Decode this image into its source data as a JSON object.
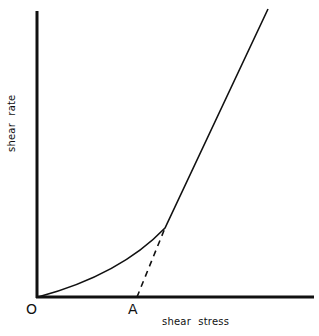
{
  "diagram": {
    "type": "line",
    "title": "",
    "xlabel": "shear stress",
    "ylabel": "shear rate",
    "points": {
      "origin": "O",
      "intercept": "A"
    },
    "curves": [
      {
        "name": "flow curve",
        "style": "solid",
        "description": "starts at origin, curves upward, becomes linear at high stress"
      },
      {
        "name": "extrapolated linear portion",
        "style": "dashed",
        "description": "extends linear region to intercept shear-stress axis at A (yield value)"
      }
    ],
    "colors": {
      "line": "#111111",
      "background": "#ffffff"
    }
  }
}
